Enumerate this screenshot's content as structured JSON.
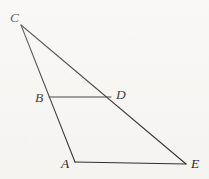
{
  "figure": {
    "kind": "geometry-diagram",
    "caption": "",
    "canvas": {
      "width": 209,
      "height": 179
    },
    "colors": {
      "background": "#f7f6f3",
      "stroke": "#2b2b2b",
      "label": "#1e1e1e"
    },
    "points": [
      {
        "id": "C",
        "label": "C",
        "x": 21,
        "y": 25,
        "label_x": 10,
        "label_y": 22
      },
      {
        "id": "B",
        "label": "B",
        "x": 49,
        "y": 97,
        "label_x": 35,
        "label_y": 102
      },
      {
        "id": "D",
        "label": "D",
        "x": 111,
        "y": 97,
        "label_x": 116,
        "label_y": 99
      },
      {
        "id": "A",
        "label": "A",
        "x": 75,
        "y": 162,
        "label_x": 61,
        "label_y": 168
      },
      {
        "id": "E",
        "label": "E",
        "x": 186,
        "y": 164,
        "label_x": 191,
        "label_y": 168
      }
    ],
    "segments": [
      {
        "id": "CA",
        "from": "C",
        "to": "A",
        "note": "passes through B"
      },
      {
        "id": "CE",
        "from": "C",
        "to": "E",
        "note": "passes through D"
      },
      {
        "id": "BD",
        "from": "B",
        "to": "D",
        "note": "horizontal midsegment"
      },
      {
        "id": "AE",
        "from": "A",
        "to": "E",
        "note": "base"
      }
    ]
  }
}
